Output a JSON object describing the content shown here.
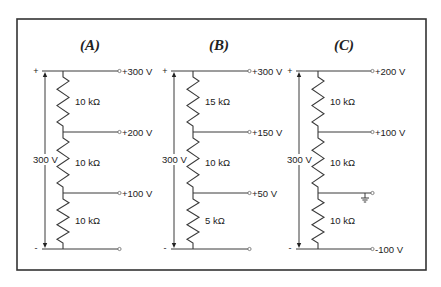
{
  "figure": {
    "circuits": [
      {
        "id": "A",
        "title": "(A)",
        "source_label": "300 V",
        "plus_sign": "+",
        "minus_sign": "-",
        "resistors": [
          "10 kΩ",
          "10 kΩ",
          "10 kΩ"
        ],
        "taps": [
          "+300 V",
          "+200 V",
          "+100 V",
          ""
        ],
        "ground_at_tap": null
      },
      {
        "id": "B",
        "title": "(B)",
        "source_label": "300 V",
        "plus_sign": "+",
        "minus_sign": "-",
        "resistors": [
          "15 kΩ",
          "10 kΩ",
          "5 kΩ"
        ],
        "taps": [
          "+300 V",
          "+150 V",
          "+50 V",
          ""
        ],
        "ground_at_tap": null
      },
      {
        "id": "C",
        "title": "(C)",
        "source_label": "300 V",
        "plus_sign": "+",
        "minus_sign": "-",
        "resistors": [
          "10 kΩ",
          "10 kΩ",
          "10 kΩ"
        ],
        "taps": [
          "+200 V",
          "+100 V",
          "",
          "-100 V"
        ],
        "ground_at_tap": 2
      }
    ]
  }
}
